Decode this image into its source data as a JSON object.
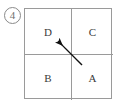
{
  "figure": {
    "item_number": "4",
    "item_number_style": "circled",
    "caption": ""
  },
  "grid": {
    "rows": 2,
    "columns": 2,
    "border_color": "#9a9a9a",
    "background_color": "#ffffff",
    "label_color": "#3a3a3a",
    "cells": [
      {
        "position": "top-left",
        "label": "D"
      },
      {
        "position": "top-right",
        "label": "C"
      },
      {
        "position": "bottom-left",
        "label": "B"
      },
      {
        "position": "bottom-right",
        "label": "A"
      }
    ]
  },
  "arrow": {
    "name": "direction-arrow",
    "color": "#111111",
    "direction": "up-left",
    "points_toward_cell": "D",
    "tail_x": 82,
    "tail_y": 65,
    "head_x": 56,
    "head_y": 39
  }
}
